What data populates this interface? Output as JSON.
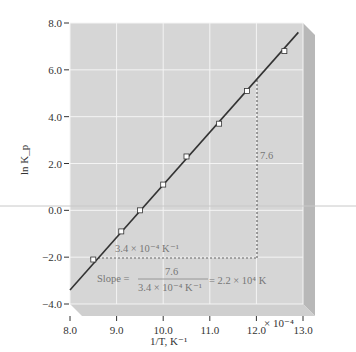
{
  "chart_data": {
    "type": "scatter",
    "title": "",
    "xlabel": "1/T, K⁻¹",
    "ylabel": "ln K_p",
    "x_multiplier_label": "× 10⁻⁴",
    "xlim": [
      8.0,
      13.0
    ],
    "ylim": [
      -4.0,
      8.0
    ],
    "xticks": [
      "8.0",
      "9.0",
      "10.0",
      "11.0",
      "12.0",
      "13.0"
    ],
    "yticks": [
      "8.0",
      "6.0",
      "4.0",
      "2.0",
      "0.0",
      "−2.0",
      "−4.0"
    ],
    "grid": true,
    "series": [
      {
        "name": "data points",
        "x": [
          8.5,
          9.1,
          9.5,
          10.0,
          10.5,
          11.2,
          11.8,
          12.6
        ],
        "y": [
          -2.1,
          -0.9,
          0.0,
          1.1,
          2.3,
          3.7,
          5.1,
          6.8
        ]
      }
    ],
    "fit_line": {
      "x": [
        8.0,
        13.5
      ],
      "y": [
        -3.4,
        8.0
      ]
    },
    "annotations": {
      "rise": "7.6",
      "run": "3.4 × 10⁻⁴ K⁻¹",
      "slope_label": "Slope =",
      "slope_num": "7.6",
      "slope_den": "3.4 × 10⁻⁴ K⁻¹",
      "slope_result": "= 2.2 × 10⁴ K"
    }
  }
}
